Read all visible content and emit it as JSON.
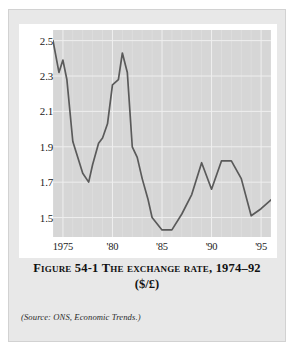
{
  "figure": {
    "caption_line1": "Figure 54-1   The exchange rate, 1974–92",
    "caption_line2": "($/£)",
    "source": "(Source: ONS, Economic Trends.)"
  },
  "colors": {
    "page_background": "#ffffff",
    "card_background": "#e8e8e8",
    "plot_background": "#d6d6d6",
    "gridline": "#efefef",
    "line": "#5a5a5a",
    "text": "#1b1b1b"
  },
  "chart_data": {
    "type": "line",
    "title": "The exchange rate, 1974–92 ($/£)",
    "xlabel": "",
    "ylabel": "",
    "grid": true,
    "legend": "none",
    "xlim": [
      1974,
      1996
    ],
    "ylim": [
      1.39,
      2.56
    ],
    "yticks": [
      2.5,
      2.3,
      2.1,
      1.9,
      1.7,
      1.5
    ],
    "ytick_labels": [
      "2.5",
      "2.3",
      "2.1",
      "1.9",
      "1.7",
      "1.5"
    ],
    "xticks": [
      1975,
      1980,
      1985,
      1990,
      1995
    ],
    "xtick_labels": [
      "1975",
      "'80",
      "'85",
      "'90",
      "'95"
    ],
    "series": [
      {
        "name": "$/£ exchange rate",
        "x": [
          1974.0,
          1974.6,
          1975.0,
          1975.4,
          1976.0,
          1977.0,
          1977.6,
          1978.0,
          1978.6,
          1979.0,
          1979.5,
          1980.0,
          1980.6,
          1981.0,
          1981.5,
          1982.0,
          1982.5,
          1983.0,
          1983.6,
          1984.0,
          1985.0,
          1985.6,
          1986.0,
          1987.0,
          1988.0,
          1989.0,
          1990.0,
          1991.0,
          1992.0,
          1993.0,
          1994.0,
          1995.0,
          1996.0
        ],
        "y": [
          2.5,
          2.32,
          2.39,
          2.28,
          1.93,
          1.75,
          1.7,
          1.8,
          1.92,
          1.95,
          2.03,
          2.25,
          2.28,
          2.43,
          2.32,
          1.9,
          1.84,
          1.72,
          1.6,
          1.5,
          1.43,
          1.43,
          1.43,
          1.52,
          1.63,
          1.81,
          1.66,
          1.82,
          1.82,
          1.72,
          1.51,
          1.55,
          1.6
        ]
      }
    ]
  }
}
